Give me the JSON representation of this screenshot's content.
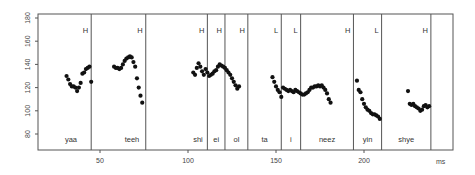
{
  "chart_data": {
    "type": "scatter",
    "title": "",
    "xlabel": "ms",
    "ylabel": "",
    "xlim": [
      0,
      250
    ],
    "ylim": [
      65,
      185
    ],
    "grid": false,
    "x_ticks": [
      50,
      100,
      150,
      200
    ],
    "y_ticks": [
      80,
      100,
      120,
      140,
      160,
      180
    ],
    "segments": [
      {
        "syllable": "yaa",
        "start": 0,
        "end": 45,
        "tone": "H"
      },
      {
        "syllable": "teeh",
        "start": 45,
        "end": 76,
        "tone": "H"
      },
      {
        "syllable": "shi",
        "start": 76,
        "end": 111,
        "tone": "H"
      },
      {
        "syllable": "ei",
        "start": 111,
        "end": 121,
        "tone": "H"
      },
      {
        "syllable": "ol",
        "start": 121,
        "end": 134,
        "tone": "H"
      },
      {
        "syllable": "ta",
        "start": 134,
        "end": 153,
        "tone": "L"
      },
      {
        "syllable": "i",
        "start": 153,
        "end": 164,
        "tone": "L"
      },
      {
        "syllable": "neez",
        "start": 164,
        "end": 194,
        "tone": "H"
      },
      {
        "syllable": "yin",
        "start": 194,
        "end": 210,
        "tone": "L"
      },
      {
        "syllable": "shye",
        "start": 210,
        "end": 238,
        "tone": "H"
      }
    ],
    "series": [
      {
        "name": "F0 (Hz)",
        "points": [
          [
            31,
            130
          ],
          [
            32,
            127
          ],
          [
            33,
            123
          ],
          [
            34,
            121
          ],
          [
            35,
            121
          ],
          [
            36,
            120
          ],
          [
            37,
            117
          ],
          [
            38,
            120
          ],
          [
            39,
            124
          ],
          [
            40,
            132
          ],
          [
            41,
            133
          ],
          [
            42,
            136
          ],
          [
            43,
            137
          ],
          [
            44,
            138
          ],
          [
            45,
            125
          ],
          [
            58,
            138
          ],
          [
            59,
            137
          ],
          [
            60,
            137
          ],
          [
            61,
            136
          ],
          [
            62,
            137
          ],
          [
            63,
            140
          ],
          [
            64,
            143
          ],
          [
            65,
            145
          ],
          [
            66,
            146
          ],
          [
            67,
            147
          ],
          [
            68,
            146
          ],
          [
            69,
            142
          ],
          [
            70,
            138
          ],
          [
            71,
            128
          ],
          [
            72,
            120
          ],
          [
            73,
            113
          ],
          [
            74,
            107
          ],
          [
            103,
            133
          ],
          [
            104,
            131
          ],
          [
            105,
            137
          ],
          [
            106,
            141
          ],
          [
            107,
            138
          ],
          [
            108,
            134
          ],
          [
            109,
            131
          ],
          [
            110,
            136
          ],
          [
            111,
            133
          ],
          [
            112,
            130
          ],
          [
            113,
            131
          ],
          [
            114,
            132
          ],
          [
            115,
            134
          ],
          [
            116,
            135
          ],
          [
            117,
            138
          ],
          [
            118,
            140
          ],
          [
            119,
            139
          ],
          [
            120,
            138
          ],
          [
            121,
            137
          ],
          [
            122,
            135
          ],
          [
            123,
            133
          ],
          [
            124,
            131
          ],
          [
            125,
            128
          ],
          [
            126,
            125
          ],
          [
            127,
            122
          ],
          [
            128,
            119
          ],
          [
            129,
            121
          ],
          [
            148,
            129
          ],
          [
            149,
            125
          ],
          [
            150,
            121
          ],
          [
            151,
            118
          ],
          [
            152,
            116
          ],
          [
            153,
            112
          ],
          [
            154,
            120
          ],
          [
            155,
            119
          ],
          [
            156,
            118
          ],
          [
            157,
            117
          ],
          [
            158,
            118
          ],
          [
            159,
            117
          ],
          [
            160,
            116
          ],
          [
            161,
            118
          ],
          [
            162,
            117
          ],
          [
            163,
            116
          ],
          [
            164,
            115
          ],
          [
            165,
            114
          ],
          [
            166,
            114
          ],
          [
            167,
            115
          ],
          [
            168,
            116
          ],
          [
            169,
            118
          ],
          [
            170,
            120
          ],
          [
            171,
            120
          ],
          [
            172,
            121
          ],
          [
            173,
            121
          ],
          [
            174,
            122
          ],
          [
            175,
            121
          ],
          [
            176,
            122
          ],
          [
            177,
            120
          ],
          [
            178,
            118
          ],
          [
            179,
            115
          ],
          [
            180,
            110
          ],
          [
            181,
            107
          ],
          [
            196,
            126
          ],
          [
            197,
            118
          ],
          [
            198,
            116
          ],
          [
            199,
            110
          ],
          [
            200,
            106
          ],
          [
            201,
            103
          ],
          [
            202,
            101
          ],
          [
            203,
            100
          ],
          [
            204,
            98
          ],
          [
            205,
            97
          ],
          [
            206,
            97
          ],
          [
            207,
            96
          ],
          [
            208,
            95
          ],
          [
            209,
            93
          ],
          [
            225,
            117
          ],
          [
            226,
            106
          ],
          [
            227,
            105
          ],
          [
            228,
            106
          ],
          [
            229,
            104
          ],
          [
            230,
            103
          ],
          [
            231,
            102
          ],
          [
            232,
            100
          ],
          [
            233,
            101
          ],
          [
            234,
            104
          ],
          [
            235,
            105
          ],
          [
            236,
            103
          ],
          [
            237,
            104
          ]
        ]
      }
    ]
  },
  "labels": {
    "x_unit": "ms",
    "y_ticks": [
      "80",
      "100",
      "120",
      "140",
      "160",
      "180"
    ],
    "x_ticks": [
      "50",
      "100",
      "150",
      "200"
    ]
  }
}
